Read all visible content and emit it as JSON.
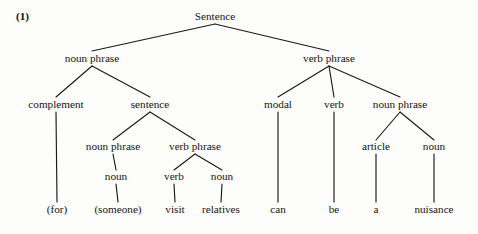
{
  "figure": {
    "example_number": "(1)",
    "sentence_text": "(for) (someone) visit relatives can be a nuisance",
    "background_color": "#fdfdfb",
    "line_color": "#1a1a1a",
    "text_color": "#141414"
  },
  "tree": {
    "nodes": [
      {
        "id": "s",
        "label": "Sentence",
        "x": 215,
        "y": 20,
        "kind": "category"
      },
      {
        "id": "np1",
        "label": "noun phrase",
        "x": 92,
        "y": 62,
        "kind": "category"
      },
      {
        "id": "vp1",
        "label": "verb phrase",
        "x": 329,
        "y": 62,
        "kind": "category"
      },
      {
        "id": "comp",
        "label": "complement",
        "x": 56,
        "y": 108,
        "kind": "category"
      },
      {
        "id": "s2",
        "label": "sentence",
        "x": 150,
        "y": 108,
        "kind": "category"
      },
      {
        "id": "modal",
        "label": "modal",
        "x": 278,
        "y": 108,
        "kind": "category"
      },
      {
        "id": "verb1",
        "label": "verb",
        "x": 334,
        "y": 108,
        "kind": "category"
      },
      {
        "id": "np2",
        "label": "noun phrase",
        "x": 400,
        "y": 108,
        "kind": "category"
      },
      {
        "id": "np3",
        "label": "noun phrase",
        "x": 113,
        "y": 150,
        "kind": "category"
      },
      {
        "id": "vp2",
        "label": "verb phrase",
        "x": 195,
        "y": 150,
        "kind": "category"
      },
      {
        "id": "article",
        "label": "article",
        "x": 376,
        "y": 150,
        "kind": "category"
      },
      {
        "id": "noun3",
        "label": "noun",
        "x": 434,
        "y": 150,
        "kind": "category"
      },
      {
        "id": "noun1",
        "label": "noun",
        "x": 116,
        "y": 180,
        "kind": "category"
      },
      {
        "id": "verb2",
        "label": "verb",
        "x": 174,
        "y": 180,
        "kind": "category"
      },
      {
        "id": "noun2",
        "label": "noun",
        "x": 222,
        "y": 180,
        "kind": "category"
      },
      {
        "id": "w_for",
        "label": "(for)",
        "x": 57,
        "y": 213,
        "kind": "word"
      },
      {
        "id": "w_someone",
        "label": "(someone)",
        "x": 118,
        "y": 213,
        "kind": "word"
      },
      {
        "id": "w_visit",
        "label": "visit",
        "x": 175,
        "y": 213,
        "kind": "word"
      },
      {
        "id": "w_relatives",
        "label": "relatives",
        "x": 221,
        "y": 213,
        "kind": "word"
      },
      {
        "id": "w_can",
        "label": "can",
        "x": 278,
        "y": 213,
        "kind": "word"
      },
      {
        "id": "w_be",
        "label": "be",
        "x": 334,
        "y": 213,
        "kind": "word"
      },
      {
        "id": "w_a",
        "label": "a",
        "x": 376,
        "y": 213,
        "kind": "word"
      },
      {
        "id": "w_nuisance",
        "label": "nuisance",
        "x": 434,
        "y": 213,
        "kind": "word"
      }
    ],
    "edges": [
      {
        "from": "s",
        "to": "np1",
        "x1": 215,
        "y1": 24,
        "x2": 92,
        "y2": 51
      },
      {
        "from": "s",
        "to": "vp1",
        "x1": 215,
        "y1": 24,
        "x2": 329,
        "y2": 51
      },
      {
        "from": "np1",
        "to": "comp",
        "x1": 92,
        "y1": 66,
        "x2": 56,
        "y2": 97
      },
      {
        "from": "np1",
        "to": "s2",
        "x1": 92,
        "y1": 66,
        "x2": 150,
        "y2": 97
      },
      {
        "from": "vp1",
        "to": "modal",
        "x1": 329,
        "y1": 66,
        "x2": 278,
        "y2": 97
      },
      {
        "from": "vp1",
        "to": "verb1",
        "x1": 329,
        "y1": 66,
        "x2": 334,
        "y2": 97
      },
      {
        "from": "vp1",
        "to": "np2",
        "x1": 329,
        "y1": 66,
        "x2": 400,
        "y2": 97
      },
      {
        "from": "s2",
        "to": "np3",
        "x1": 150,
        "y1": 112,
        "x2": 113,
        "y2": 140
      },
      {
        "from": "s2",
        "to": "vp2",
        "x1": 150,
        "y1": 112,
        "x2": 195,
        "y2": 140
      },
      {
        "from": "np2",
        "to": "article",
        "x1": 400,
        "y1": 112,
        "x2": 376,
        "y2": 140
      },
      {
        "from": "np2",
        "to": "noun3",
        "x1": 400,
        "y1": 112,
        "x2": 434,
        "y2": 140
      },
      {
        "from": "np3",
        "to": "noun1",
        "x1": 113,
        "y1": 154,
        "x2": 116,
        "y2": 170
      },
      {
        "from": "vp2",
        "to": "verb2",
        "x1": 195,
        "y1": 154,
        "x2": 174,
        "y2": 170
      },
      {
        "from": "vp2",
        "to": "noun2",
        "x1": 195,
        "y1": 154,
        "x2": 222,
        "y2": 170
      },
      {
        "from": "comp",
        "to": "w_for",
        "x1": 56,
        "y1": 112,
        "x2": 57,
        "y2": 202
      },
      {
        "from": "noun1",
        "to": "w_someone",
        "x1": 116,
        "y1": 184,
        "x2": 118,
        "y2": 202
      },
      {
        "from": "verb2",
        "to": "w_visit",
        "x1": 174,
        "y1": 184,
        "x2": 175,
        "y2": 202
      },
      {
        "from": "noun2",
        "to": "w_relatives",
        "x1": 222,
        "y1": 184,
        "x2": 221,
        "y2": 202
      },
      {
        "from": "modal",
        "to": "w_can",
        "x1": 278,
        "y1": 112,
        "x2": 278,
        "y2": 202
      },
      {
        "from": "verb1",
        "to": "w_be",
        "x1": 334,
        "y1": 112,
        "x2": 334,
        "y2": 202
      },
      {
        "from": "article",
        "to": "w_a",
        "x1": 376,
        "y1": 154,
        "x2": 376,
        "y2": 202
      },
      {
        "from": "noun3",
        "to": "w_nuisance",
        "x1": 434,
        "y1": 154,
        "x2": 434,
        "y2": 202
      }
    ],
    "example_label_pos": {
      "x": 16,
      "y": 20
    }
  }
}
